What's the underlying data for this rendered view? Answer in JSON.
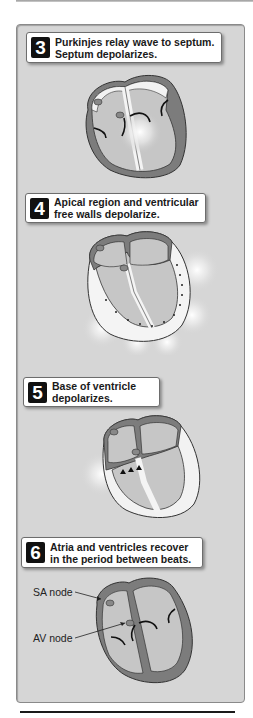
{
  "steps": [
    {
      "number": "3",
      "text": "Purkinjes relay wave to septum.\nSeptum depolarizes."
    },
    {
      "number": "4",
      "text": "Apical region and ventricular\nfree walls depolarize."
    },
    {
      "number": "5",
      "text": "Base of ventricle\ndepolarizes."
    },
    {
      "number": "6",
      "text": "Atria and ventricles recover\nin the period  between beats."
    }
  ],
  "labels": {
    "sa_node": "SA node",
    "av_node": "AV node"
  },
  "colors": {
    "panel_bg": "#d6d6d6",
    "chamber": "#c6c6c6",
    "wall": "#7c7c7c",
    "depolarized": "#f4f4f4",
    "badge": "#111111"
  }
}
